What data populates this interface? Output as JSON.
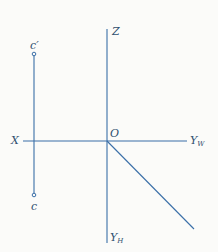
{
  "diagram": {
    "type": "orthographic-projection",
    "colors": {
      "line": "#3a6fa8",
      "label": "#2f4f6f",
      "background": "#fbfbf9"
    },
    "labels": {
      "z_axis": "Z",
      "x_axis": "X",
      "origin": "O",
      "y_w": {
        "base": "Y",
        "sub": "W"
      },
      "y_h": {
        "base": "Y",
        "sub": "H"
      },
      "point_front": "c′",
      "point_top": "c"
    },
    "geometry": {
      "z_axis": {
        "x": 107,
        "y1": 29,
        "y2": 243
      },
      "x_axis": {
        "y": 141,
        "x1": 23,
        "x2": 187
      },
      "diagonal": {
        "x1": 107,
        "y1": 141,
        "x2": 194,
        "y2": 229
      },
      "projector": {
        "x": 34,
        "y1": 54,
        "y2": 195
      },
      "point_c_prime": {
        "x": 34,
        "y": 54
      },
      "point_c": {
        "x": 34,
        "y": 195
      }
    }
  }
}
